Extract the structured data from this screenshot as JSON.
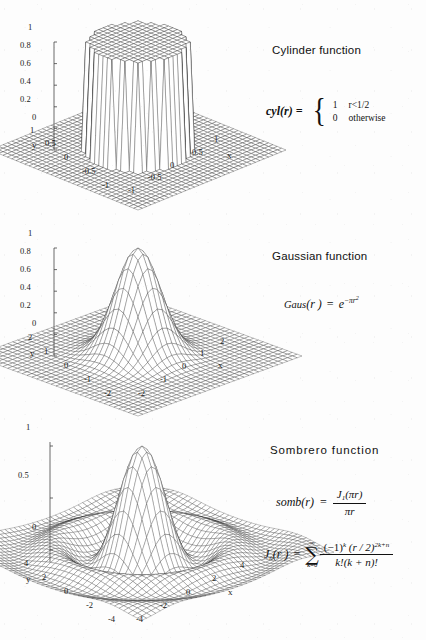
{
  "document": {
    "background_color": "#fdfdfd",
    "ink_color": "#1a1a1a"
  },
  "panels": [
    {
      "id": "cylinder",
      "title": "Cylinder function",
      "formula_text": "cyl(r) = { 1 if r<1/2 ; 0 otherwise }",
      "lhs": "cyl(r) =",
      "cases": [
        {
          "value": "1",
          "condition": "r<1/2"
        },
        {
          "value": "0",
          "condition": "otherwise"
        }
      ]
    },
    {
      "id": "gaussian",
      "title": "Gaussian function",
      "formula_text": "Gaus(r) = e^(-πr²)",
      "fname": "Gaus",
      "arg": "(r )",
      "equals": "=",
      "base": "e",
      "exponent_minus": "−",
      "exponent_pi": "π",
      "exponent_r": "r",
      "exponent_power": "2"
    },
    {
      "id": "sombrero",
      "title": "Sombrero  function",
      "formula_text": "somb(r) = J₁(πr) / (πr)",
      "somb_lhs": "somb(r)",
      "somb_eq": "=",
      "somb_num_J": "J",
      "somb_num_sub": "1",
      "somb_num_arg": "(πr)",
      "somb_den": "πr",
      "bessel_text": "J_n(r) = sum_{k=0}^{∞} (-1)^k (r/2)^{2k+n} / (k!(k+n)!)",
      "bessel_lhs_J": "J",
      "bessel_lhs_sub": "n",
      "bessel_lhs_arg": "(r )",
      "bessel_eq": "=",
      "sum_upper": "∞",
      "sum_sigma": "∑",
      "sum_lower": "k=0",
      "bessel_num": "(−1)",
      "bessel_num_sup": "k",
      "bessel_num_tail": " (r / 2)",
      "bessel_num_tail_sup": "2k+n",
      "bessel_den": "k!(k + n)!"
    }
  ],
  "chart_data": [
    {
      "type": "surface",
      "id": "cylinder",
      "title": "Cylinder function",
      "function": "cyl(r)",
      "xlabel": "x",
      "ylabel": "y",
      "zlabel": "",
      "xlim": [
        -1,
        1
      ],
      "ylim": [
        -1,
        1
      ],
      "zlim": [
        0,
        1
      ],
      "x_ticks": [
        "-1",
        "-0.5",
        "0",
        "0.5",
        "1"
      ],
      "y_ticks": [
        "1",
        "0.5",
        "0",
        "-0.5",
        "-1"
      ],
      "z_ticks": [
        "1",
        "0.8",
        "0.6",
        "0.4",
        "0.2",
        "0"
      ],
      "z_tick_values": [
        1,
        0.8,
        0.6,
        0.4,
        0.2,
        0
      ],
      "grid_n": 34,
      "grid": false,
      "legend": "none",
      "description": "Unit-height circular cylinder of radius 1/2 on a flat zero plane"
    },
    {
      "type": "surface",
      "id": "gaussian",
      "title": "Gaussian function",
      "function": "exp(-pi*r^2)",
      "xlabel": "x",
      "ylabel": "y",
      "zlabel": "",
      "xlim": [
        -2,
        2
      ],
      "ylim": [
        -2,
        2
      ],
      "zlim": [
        0,
        1
      ],
      "x_ticks": [
        "-2",
        "-1",
        "0",
        "1",
        "2"
      ],
      "y_ticks": [
        "2",
        "1",
        "0",
        "-1",
        "-2"
      ],
      "z_ticks": [
        "1",
        "0.8",
        "0.6",
        "0.4",
        "0.2",
        "0"
      ],
      "z_tick_values": [
        1,
        0.8,
        0.6,
        0.4,
        0.2,
        0
      ],
      "grid_n": 34,
      "grid": false,
      "legend": "none",
      "description": "Rotationally symmetric Gaussian bump peaking at 1 at the origin"
    },
    {
      "type": "surface",
      "id": "sombrero",
      "title": "Sombrero function",
      "function": "2*J1(pi*r)/(pi*r)",
      "xlabel": "x",
      "ylabel": "y",
      "zlabel": "",
      "xlim": [
        -4,
        4
      ],
      "ylim": [
        -4,
        4
      ],
      "zlim": [
        -0.15,
        1
      ],
      "x_ticks": [
        "-4",
        "-2",
        "0",
        "2",
        "4"
      ],
      "y_ticks": [
        "4",
        "2",
        "0",
        "-2",
        "-4"
      ],
      "z_ticks": [
        "1",
        "0.5",
        "0"
      ],
      "z_tick_values": [
        1,
        0.5,
        0
      ],
      "grid_n": 42,
      "grid": false,
      "legend": "none",
      "description": "Jinc / sombrero function with a central lobe and concentric ring ripples"
    }
  ]
}
